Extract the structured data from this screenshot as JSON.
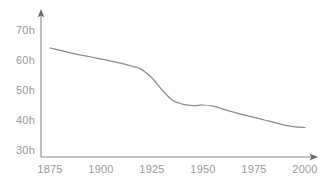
{
  "chart_data": {
    "type": "line",
    "title": "",
    "subtitle": "",
    "xlabel": "",
    "ylabel": "",
    "xlim": [
      1875,
      2000
    ],
    "ylim": [
      30,
      70
    ],
    "grid": false,
    "legend": null,
    "legend_position": "none",
    "axis_style": "arrowed-open",
    "x_ticks": [
      1875,
      1900,
      1925,
      1950,
      1975,
      2000
    ],
    "x_tick_labels": [
      "1875",
      "1900",
      "1925",
      "1950",
      "1975",
      "2000"
    ],
    "y_ticks": [
      30,
      40,
      50,
      60,
      70
    ],
    "y_tick_labels": [
      "30h",
      "40h",
      "50h",
      "60h",
      "70h"
    ],
    "unit_suffix": "h",
    "series": [
      {
        "name": "",
        "color": "#8b8b8b",
        "x": [
          1875,
          1885,
          1895,
          1905,
          1915,
          1920,
          1925,
          1930,
          1935,
          1940,
          1945,
          1950,
          1955,
          1960,
          1965,
          1970,
          1975,
          1980,
          1985,
          1990,
          1995,
          2000
        ],
        "values": [
          64.0,
          62.4,
          61.0,
          59.6,
          58.0,
          56.8,
          54.0,
          50.0,
          46.6,
          45.3,
          44.8,
          45.0,
          44.6,
          43.6,
          42.6,
          41.7,
          40.9,
          40.0,
          39.2,
          38.3,
          37.7,
          37.5
        ]
      }
    ]
  },
  "colors": {
    "background": "#ffffff",
    "axis": "#8a8a8a",
    "arrow": "#6a6a6a",
    "tick_text": "#9a9a9a",
    "line": "#8b8b8b"
  }
}
